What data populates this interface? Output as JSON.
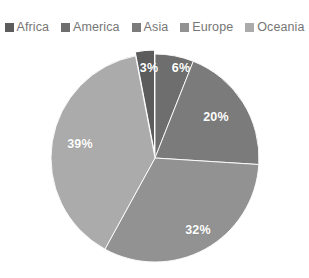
{
  "chart_data": {
    "type": "pie",
    "title": "",
    "subtitle": "",
    "xlabel": "",
    "ylabel": "",
    "grid": false,
    "legend_position": "top",
    "units": "percent",
    "start_angle_deg": 0,
    "direction": "clockwise",
    "total": 100,
    "categories": [
      "Africa",
      "America",
      "Asia",
      "Europe",
      "Oceania"
    ],
    "values": [
      3,
      6,
      20,
      32,
      39
    ],
    "value_labels": [
      "3%",
      "6%",
      "20%",
      "32%",
      "39%"
    ],
    "colors": [
      "#5c5c5c",
      "#6e6e6e",
      "#7b7b7b",
      "#929292",
      "#ababab"
    ],
    "slices": [
      {
        "name": "Africa",
        "value": 3,
        "label": "3%",
        "color": "#5c5c5c",
        "legend_swatch_color": "#5c5c5c",
        "start_angle_deg": 349.2,
        "end_angle_deg": 360.0,
        "label_x": 149,
        "label_y": 68,
        "exploded": true
      },
      {
        "name": "America",
        "value": 6,
        "label": "6%",
        "color": "#6e6e6e",
        "legend_swatch_color": "#6e6e6e",
        "start_angle_deg": 0.0,
        "end_angle_deg": 21.6,
        "label_x": 181,
        "label_y": 68,
        "exploded": false
      },
      {
        "name": "Asia",
        "value": 20,
        "label": "20%",
        "color": "#7b7b7b",
        "legend_swatch_color": "#7b7b7b",
        "start_angle_deg": 21.6,
        "end_angle_deg": 93.6,
        "label_x": 216,
        "label_y": 117,
        "exploded": false
      },
      {
        "name": "Europe",
        "value": 32,
        "label": "32%",
        "color": "#929292",
        "legend_swatch_color": "#929292",
        "start_angle_deg": 93.6,
        "end_angle_deg": 208.8,
        "label_x": 198,
        "label_y": 230,
        "exploded": false
      },
      {
        "name": "Oceania",
        "value": 39,
        "label": "39%",
        "color": "#ababab",
        "legend_swatch_color": "#ababab",
        "start_angle_deg": 208.8,
        "end_angle_deg": 349.2,
        "label_x": 80,
        "label_y": 144,
        "exploded": false
      }
    ]
  },
  "legend": {
    "items": [
      {
        "label": "Africa",
        "color": "#5c5c5c"
      },
      {
        "label": "America",
        "color": "#6e6e6e"
      },
      {
        "label": "Asia",
        "color": "#7b7b7b"
      },
      {
        "label": "Europe",
        "color": "#929292"
      },
      {
        "label": "Oceania",
        "color": "#ababab"
      }
    ]
  },
  "geometry": {
    "center_x": 155,
    "center_y": 158,
    "radius": 104
  }
}
